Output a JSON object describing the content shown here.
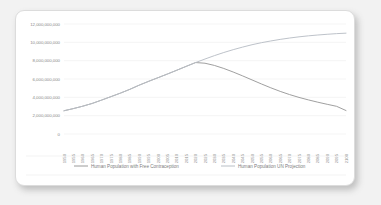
{
  "card": {
    "background": "#ffffff",
    "page_background": "#f2f2f2"
  },
  "chart_data": {
    "type": "line",
    "title": "",
    "xlabel": "",
    "ylabel": "",
    "grid": true,
    "legend_position": "bottom",
    "ylim": [
      0,
      12000000000
    ],
    "ytick_values": [
      0,
      2000000000,
      4000000000,
      6000000000,
      8000000000,
      10000000000,
      12000000000
    ],
    "ytick_labels": [
      "0",
      "2,000,000,000",
      "4,000,000,000",
      "6,000,000,000",
      "8,000,000,000",
      "10,000,000,000",
      "12,000,000,000"
    ],
    "categories": [
      "1950",
      "1955",
      "1960",
      "1965",
      "1970",
      "1975",
      "1980",
      "1985",
      "1990",
      "1995",
      "2000",
      "2005",
      "2010",
      "2015",
      "2020",
      "2025",
      "2030",
      "2035",
      "2040",
      "2045",
      "2050",
      "2055",
      "2060",
      "2065",
      "2070",
      "2075",
      "2080",
      "2085",
      "2090",
      "2095",
      "2100"
    ],
    "series": [
      {
        "name": "Human Population with Free Contraception",
        "color": "#9a9a9a",
        "values": [
          2536000000,
          2773000000,
          3035000000,
          3335000000,
          3700000000,
          4079000000,
          4458000000,
          4871000000,
          5327000000,
          5744000000,
          6143000000,
          6542000000,
          6957000000,
          7380000000,
          7795000000,
          7720000000,
          7480000000,
          7150000000,
          6760000000,
          6340000000,
          5900000000,
          5460000000,
          5040000000,
          4650000000,
          4300000000,
          3990000000,
          3720000000,
          3470000000,
          3240000000,
          3020000000,
          2560000000
        ]
      },
      {
        "name": "Human Population UN Projection",
        "color": "#b9bfc6",
        "values": [
          2536000000,
          2773000000,
          3035000000,
          3335000000,
          3700000000,
          4079000000,
          4458000000,
          4871000000,
          5327000000,
          5744000000,
          6143000000,
          6542000000,
          6957000000,
          7380000000,
          7795000000,
          8180000000,
          8550000000,
          8890000000,
          9200000000,
          9480000000,
          9740000000,
          9960000000,
          10150000000,
          10320000000,
          10470000000,
          10600000000,
          10710000000,
          10800000000,
          10880000000,
          10950000000,
          11000000000
        ]
      }
    ]
  }
}
